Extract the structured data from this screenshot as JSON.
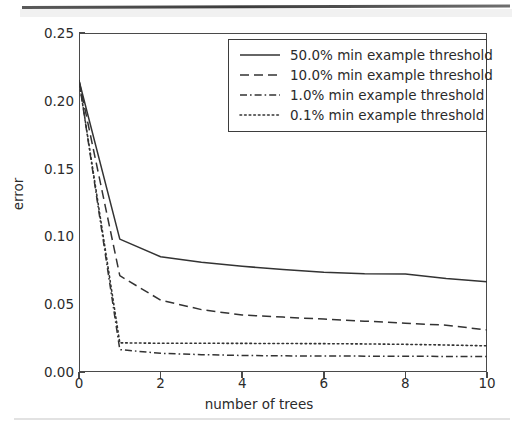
{
  "figure": {
    "ylabel": "error",
    "xlabel": "number of trees",
    "yticks": [
      "0.00",
      "0.05",
      "0.10",
      "0.15",
      "0.20",
      "0.25"
    ],
    "xticks": [
      "0",
      "2",
      "4",
      "6",
      "8",
      "10"
    ]
  },
  "legend": {
    "entries": [
      {
        "label": "50.0% min example threshold",
        "style": "solid"
      },
      {
        "label": "10.0% min example threshold",
        "style": "dashed"
      },
      {
        "label": "1.0% min example threshold",
        "style": "dashdot"
      },
      {
        "label": "0.1% min example threshold",
        "style": "dotted"
      }
    ]
  },
  "chart_data": {
    "type": "line",
    "title": "",
    "xlabel": "number of trees",
    "ylabel": "error",
    "xlim": [
      0,
      10
    ],
    "ylim": [
      0.0,
      0.25
    ],
    "xticks": [
      0,
      2,
      4,
      6,
      8,
      10
    ],
    "yticks": [
      0.0,
      0.05,
      0.1,
      0.15,
      0.2,
      0.25
    ],
    "grid": false,
    "legend_position": "upper right",
    "x": [
      0,
      1,
      2,
      3,
      4,
      5,
      6,
      7,
      8,
      9,
      10
    ],
    "series": [
      {
        "name": "50.0% min example threshold",
        "style": "solid",
        "color": "#333333",
        "values": [
          0.215,
          0.098,
          0.085,
          0.081,
          0.078,
          0.0755,
          0.0735,
          0.0725,
          0.0722,
          0.069,
          0.0665
        ]
      },
      {
        "name": "10.0% min example threshold",
        "style": "dashed",
        "color": "#333333",
        "values": [
          0.215,
          0.071,
          0.053,
          0.046,
          0.042,
          0.0405,
          0.039,
          0.0375,
          0.036,
          0.0345,
          0.031
        ]
      },
      {
        "name": "1.0% min example threshold",
        "style": "dashdot",
        "color": "#333333",
        "values": [
          0.215,
          0.0165,
          0.0138,
          0.0128,
          0.0122,
          0.0119,
          0.0118,
          0.0117,
          0.0116,
          0.0115,
          0.0114
        ]
      },
      {
        "name": "0.1% min example threshold",
        "style": "dotted",
        "color": "#333333",
        "values": [
          0.215,
          0.0215,
          0.0212,
          0.0212,
          0.0211,
          0.021,
          0.0209,
          0.0207,
          0.0204,
          0.0199,
          0.0193
        ]
      }
    ]
  }
}
